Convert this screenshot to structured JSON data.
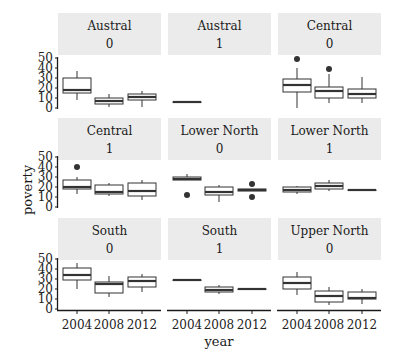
{
  "chart_data": {
    "type": "box",
    "title": "",
    "xlabel": "year",
    "ylabel": "poverty",
    "ylim": [
      0,
      50
    ],
    "yticks": [
      "0",
      "10",
      "20",
      "30",
      "40",
      "50"
    ],
    "categories": [
      "2004",
      "2008",
      "2012"
    ],
    "legend": "none",
    "grid": false,
    "facets": [
      {
        "region": "Austral",
        "group": "0",
        "boxes": [
          {
            "x": "2004",
            "min": 8,
            "q1": 15,
            "median": 18,
            "q3": 30,
            "max": 37,
            "outliers": []
          },
          {
            "x": "2008",
            "min": 1,
            "q1": 4,
            "median": 7,
            "q3": 10,
            "max": 14,
            "outliers": []
          },
          {
            "x": "2012",
            "min": 1,
            "q1": 8,
            "median": 11,
            "q3": 14,
            "max": 17,
            "outliers": []
          }
        ]
      },
      {
        "region": "Austral",
        "group": "1",
        "boxes": [
          {
            "x": "2004",
            "min": 6,
            "q1": 6,
            "median": 6,
            "q3": 6,
            "max": 6,
            "outliers": []
          }
        ]
      },
      {
        "region": "Central",
        "group": "0",
        "boxes": [
          {
            "x": "2004",
            "min": 0,
            "q1": 16,
            "median": 23,
            "q3": 29,
            "max": 40,
            "outliers": [
              49
            ]
          },
          {
            "x": "2008",
            "min": 5,
            "q1": 10,
            "median": 17,
            "q3": 21,
            "max": 34,
            "outliers": [
              39
            ]
          },
          {
            "x": "2012",
            "min": 5,
            "q1": 10,
            "median": 14,
            "q3": 19,
            "max": 31,
            "outliers": []
          }
        ]
      },
      {
        "region": "Central",
        "group": "1",
        "boxes": [
          {
            "x": "2004",
            "min": 13,
            "q1": 18,
            "median": 20,
            "q3": 27,
            "max": 30,
            "outliers": [
              40
            ]
          },
          {
            "x": "2008",
            "min": 11,
            "q1": 13,
            "median": 15,
            "q3": 22,
            "max": 24,
            "outliers": []
          },
          {
            "x": "2012",
            "min": 7,
            "q1": 11,
            "median": 16,
            "q3": 24,
            "max": 27,
            "outliers": []
          }
        ]
      },
      {
        "region": "Lower North",
        "group": "0",
        "boxes": [
          {
            "x": "2004",
            "min": 27,
            "q1": 27,
            "median": 28,
            "q3": 30,
            "max": 33,
            "outliers": [
              12
            ]
          },
          {
            "x": "2008",
            "min": 5,
            "q1": 12,
            "median": 15,
            "q3": 20,
            "max": 22,
            "outliers": []
          },
          {
            "x": "2012",
            "min": 16,
            "q1": 16,
            "median": 17,
            "q3": 18,
            "max": 18,
            "outliers": [
              23,
              10
            ]
          }
        ]
      },
      {
        "region": "Lower North",
        "group": "1",
        "boxes": [
          {
            "x": "2004",
            "min": 13,
            "q1": 15,
            "median": 17,
            "q3": 20,
            "max": 21,
            "outliers": []
          },
          {
            "x": "2008",
            "min": 16,
            "q1": 18,
            "median": 21,
            "q3": 24,
            "max": 27,
            "outliers": []
          },
          {
            "x": "2012",
            "min": 17,
            "q1": 17,
            "median": 17,
            "q3": 17,
            "max": 17,
            "outliers": []
          }
        ]
      },
      {
        "region": "South",
        "group": "0",
        "boxes": [
          {
            "x": "2004",
            "min": 20,
            "q1": 29,
            "median": 34,
            "q3": 41,
            "max": 46,
            "outliers": []
          },
          {
            "x": "2008",
            "min": 12,
            "q1": 16,
            "median": 25,
            "q3": 27,
            "max": 33,
            "outliers": []
          },
          {
            "x": "2012",
            "min": 17,
            "q1": 22,
            "median": 28,
            "q3": 32,
            "max": 35,
            "outliers": []
          }
        ]
      },
      {
        "region": "South",
        "group": "1",
        "boxes": [
          {
            "x": "2004",
            "min": 29,
            "q1": 29,
            "median": 29,
            "q3": 29,
            "max": 29,
            "outliers": []
          },
          {
            "x": "2008",
            "min": 15,
            "q1": 17,
            "median": 19,
            "q3": 22,
            "max": 24,
            "outliers": []
          },
          {
            "x": "2012",
            "min": 20,
            "q1": 20,
            "median": 20,
            "q3": 20,
            "max": 20,
            "outliers": []
          }
        ]
      },
      {
        "region": "Upper North",
        "group": "0",
        "boxes": [
          {
            "x": "2004",
            "min": 14,
            "q1": 20,
            "median": 26,
            "q3": 32,
            "max": 37,
            "outliers": []
          },
          {
            "x": "2008",
            "min": 4,
            "q1": 7,
            "median": 13,
            "q3": 18,
            "max": 22,
            "outliers": []
          },
          {
            "x": "2012",
            "min": 5,
            "q1": 10,
            "median": 11,
            "q3": 17,
            "max": 20,
            "outliers": []
          }
        ]
      }
    ]
  }
}
